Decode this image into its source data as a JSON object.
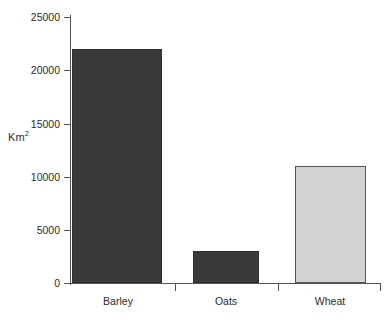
{
  "chart_data": {
    "type": "bar",
    "title": "",
    "subtitle": "",
    "xlabel": "",
    "ylabel": "Km2",
    "ylabel_display": "Km",
    "ylabel_superscript": "2",
    "categories": [
      "Barley",
      "Oats",
      "Wheat"
    ],
    "values": [
      22000,
      3000,
      11000
    ],
    "series": [
      {
        "name": "Area",
        "values": [
          22000,
          3000,
          11000
        ]
      }
    ],
    "ylim": [
      0,
      25000
    ],
    "yticks": [
      0,
      5000,
      10000,
      15000,
      20000,
      25000
    ],
    "ytick_labels": [
      "0",
      "5000",
      "10000",
      "15000",
      "20000",
      "25000"
    ],
    "grid": false,
    "legend": false,
    "legend_position": "none",
    "bar_colors": [
      "#3a3a3a",
      "#3a3a3a",
      "#d4d4d4"
    ],
    "bar_border_colors": [
      "#2e2e2e",
      "#2e2e2e",
      "#555555"
    ],
    "axis_color": "#545454",
    "background_color": "#ffffff",
    "text_color": "#2b2b2b"
  }
}
